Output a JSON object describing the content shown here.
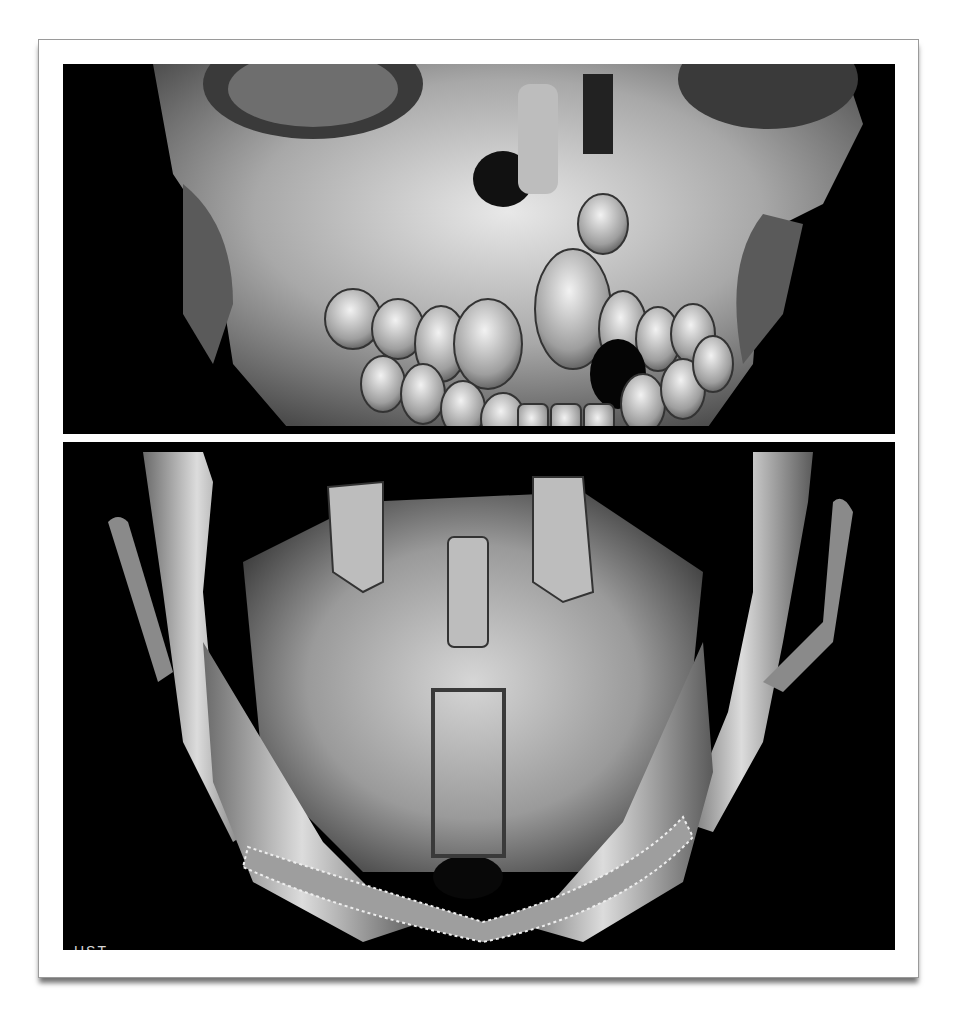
{
  "figure": {
    "panels": [
      {
        "id": "top",
        "description": "3D CT volume rendering, frontal view of skull and maxilla with irregular dentition",
        "background": "#000000"
      },
      {
        "id": "bottom",
        "description": "3D CT volume rendering, view of mandible with cut inferior border",
        "background": "#000000",
        "annotation": {
          "type": "rectangle",
          "stroke": "#3a3a3a",
          "x": 431,
          "y": 688,
          "width": 75,
          "height": 170
        },
        "corner_label": "HST"
      }
    ],
    "caption": ""
  },
  "colors": {
    "page_background": "#ffffff",
    "frame_border": "#9a9a9a",
    "panel_background": "#000000",
    "bone_light": "#e6e6e6",
    "bone_mid": "#9c9c9c",
    "bone_dark": "#4a4a4a"
  }
}
